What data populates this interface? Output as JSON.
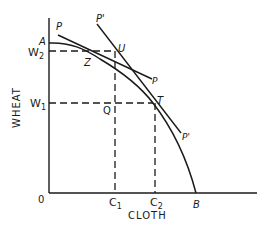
{
  "diagram": {
    "axes": {
      "x_label": "CLOTH",
      "y_label": "WHEAT",
      "origin_label": "0"
    },
    "tick_labels": {
      "w1": {
        "base": "W",
        "sub": "1"
      },
      "w2": {
        "base": "W",
        "sub": "2"
      },
      "c1": {
        "base": "C",
        "sub": "1"
      },
      "c2": {
        "base": "C",
        "sub": "2"
      }
    },
    "curve": {
      "start_label": "A",
      "end_label": "B"
    },
    "points": {
      "z": "Z",
      "u": "U",
      "t": "T",
      "q": "Q"
    },
    "price_lines": {
      "p_top": "P",
      "p_bottom": "P",
      "p_prime_top": "P'",
      "p_prime_bottom": "P'"
    },
    "colors": {
      "ink": "#1a1a1a",
      "background": "#ffffff"
    }
  }
}
